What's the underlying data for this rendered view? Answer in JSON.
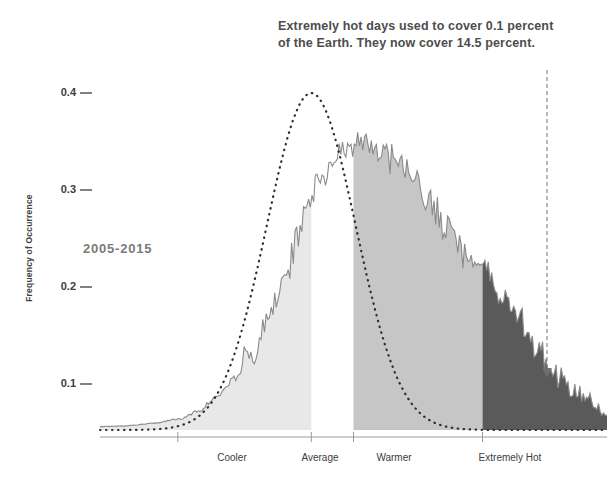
{
  "annotation": {
    "line1": "Extremely hot days used to cover 0.1 percent",
    "line2": "of the Earth. They now cover 14.5 percent."
  },
  "period_label": "2005-2015",
  "chart_data": {
    "type": "area",
    "title": "",
    "subtitle": "",
    "xlabel": "",
    "ylabel": "Frequency of Occurrence",
    "ylim": [
      0,
      0.44
    ],
    "yticks": [
      0.1,
      0.2,
      0.3,
      0.4
    ],
    "ytick_labels": [
      "0.1",
      "0.2",
      "0.3",
      "0.4"
    ],
    "xlim": [
      -5.2,
      6.2
    ],
    "xtick_labels": [
      "Cooler",
      "Average",
      "Warmer",
      "Extremely Hot"
    ],
    "xtick_positions": [
      -3.45,
      -0.45,
      0.5,
      3.4
    ],
    "grid": false,
    "legend_position": "none",
    "colors": {
      "cooler_band": "#e8e8e8",
      "warmer_band": "#c6c6c6",
      "extremely_hot_band": "#5a5a5a",
      "reference_curve": "#3a3a3a",
      "histogram_line": "#8a8a8a",
      "axis": "#9a9a9a",
      "annotation_text": "#4d4d4d",
      "period_text": "#7a7a7a"
    },
    "bands": [
      {
        "name": "Cooler",
        "x_start": -5.2,
        "x_end": -0.45,
        "color": "#e8e8e8"
      },
      {
        "name": "Warmer",
        "x_start": 0.5,
        "x_end": 3.4,
        "color": "#c6c6c6"
      },
      {
        "name": "Extremely Hot",
        "x_start": 3.4,
        "x_end": 6.2,
        "color": "#5a5a5a"
      }
    ],
    "annotations": [
      {
        "type": "vline-arrow",
        "x": 4.85,
        "label": "extremely-hot-threshold"
      }
    ],
    "series": [
      {
        "name": "Reference distribution (1951-1980)",
        "style": "dotted",
        "mean": -0.45,
        "sigma": 1.0,
        "peak": 0.4,
        "x": [
          -5.2,
          -4.8,
          -4.4,
          -4.0,
          -3.6,
          -3.2,
          -2.8,
          -2.4,
          -2.0,
          -1.6,
          -1.2,
          -0.8,
          -0.45,
          0.0,
          0.4,
          0.8,
          1.2,
          1.6,
          2.0,
          2.4,
          2.8,
          3.2,
          3.6,
          4.0
        ],
        "values": [
          0.002,
          0.003,
          0.005,
          0.009,
          0.017,
          0.03,
          0.052,
          0.084,
          0.126,
          0.177,
          0.231,
          0.281,
          0.4,
          0.285,
          0.24,
          0.188,
          0.138,
          0.095,
          0.06,
          0.036,
          0.02,
          0.01,
          0.005,
          0.002
        ]
      },
      {
        "name": "Observed distribution 2005-2015",
        "style": "jagged-area",
        "x": [
          -5.2,
          -4.6,
          -4.0,
          -3.4,
          -3.0,
          -2.6,
          -2.2,
          -1.8,
          -1.4,
          -1.0,
          -0.6,
          -0.2,
          0.2,
          0.6,
          1.0,
          1.4,
          1.8,
          2.2,
          2.6,
          3.0,
          3.4,
          3.8,
          4.2,
          4.6,
          5.0,
          5.4,
          5.8,
          6.2
        ],
        "values": [
          0.004,
          0.005,
          0.008,
          0.013,
          0.022,
          0.038,
          0.06,
          0.09,
          0.135,
          0.192,
          0.25,
          0.3,
          0.33,
          0.345,
          0.33,
          0.32,
          0.3,
          0.27,
          0.235,
          0.205,
          0.195,
          0.16,
          0.13,
          0.095,
          0.07,
          0.05,
          0.035,
          0.015
        ]
      }
    ],
    "facts": {
      "old_extreme_coverage_percent": 0.1,
      "new_extreme_coverage_percent": 14.5
    }
  }
}
